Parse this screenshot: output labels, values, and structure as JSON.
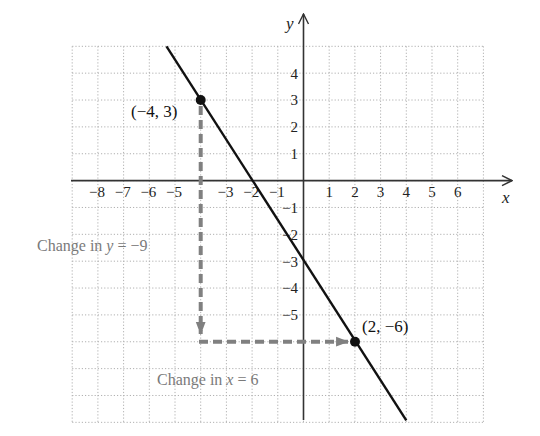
{
  "chart_data": {
    "type": "line",
    "title": "",
    "xlabel": "x",
    "ylabel": "y",
    "xlim": [
      -9,
      7
    ],
    "ylim": [
      -9,
      5
    ],
    "grid": true,
    "grid_style": "dotted",
    "x_ticks": [
      -8,
      -7,
      -6,
      -5,
      -3,
      -2,
      -1,
      1,
      2,
      3,
      4,
      5,
      6
    ],
    "x_tick_labels": [
      "−8",
      "−7",
      "−6",
      "−5",
      "−3",
      "−2",
      "−1",
      "1",
      "2",
      "3",
      "4",
      "5",
      "6"
    ],
    "y_ticks": [
      4,
      3,
      2,
      1,
      -1,
      -2,
      -3,
      -4,
      -5
    ],
    "y_tick_labels": [
      "4",
      "3",
      "2",
      "1",
      "−1",
      "−2",
      "−3",
      "−4",
      "−5"
    ],
    "series": [
      {
        "name": "line",
        "equation": "y = -1.5x - 3",
        "x": [
          -5.333,
          4
        ],
        "y": [
          5,
          -9
        ],
        "color": "#111111"
      }
    ],
    "points": [
      {
        "x": -4,
        "y": 3,
        "label": "(−4, 3)"
      },
      {
        "x": 2,
        "y": -6,
        "label": "(2, −6)"
      }
    ],
    "annotations": [
      {
        "type": "dashed-arrow",
        "from": [
          -4,
          3
        ],
        "to": [
          -4,
          -6
        ],
        "label": "Change in y = −9",
        "color": "#808080"
      },
      {
        "type": "dashed-arrow",
        "from": [
          -4,
          -6
        ],
        "to": [
          2,
          -6
        ],
        "label": "Change in x = 6",
        "color": "#808080"
      }
    ],
    "rise": -9,
    "run": 6
  },
  "labels": {
    "x_axis": "x",
    "y_axis": "y",
    "point_a": "(−4, 3)",
    "point_b": "(2, −6)",
    "change_y_prefix": "Change in ",
    "change_y_var": "y",
    "change_y_suffix": " = −9",
    "change_x_prefix": "Change in ",
    "change_x_var": "x",
    "change_x_suffix": " = 6"
  },
  "ticks": {
    "x": [
      "−8",
      "−7",
      "−6",
      "−5",
      "−3",
      "−2",
      "−1",
      "1",
      "2",
      "3",
      "4",
      "5",
      "6"
    ],
    "y_pos": [
      "4",
      "3",
      "2",
      "1"
    ],
    "y_neg": [
      "−1",
      "−2",
      "−3",
      "−4",
      "−5"
    ]
  },
  "colors": {
    "line": "#111111",
    "axis": "#333333",
    "grid": "#b8b8b8",
    "annotation": "#808080",
    "annotation_text": "#7a7a7a"
  }
}
